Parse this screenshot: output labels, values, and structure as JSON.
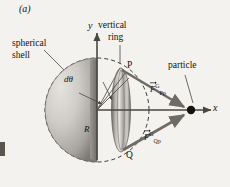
{
  "figure": {
    "panel_label": "(a)",
    "background_color": "#f4f2ee",
    "ink_color": "#14110f"
  },
  "axes": {
    "y_label": "y",
    "x_label": "x",
    "origin": {
      "x": 97,
      "y": 110
    }
  },
  "callouts": {
    "shell_line1": "spherical",
    "shell_line2": "shell",
    "ring_line1": "vertical",
    "ring_line2": "ring",
    "particle": "particle"
  },
  "points": {
    "p_label": "P",
    "q_label": "Q",
    "radius_label": "R",
    "angle_label": "dθ"
  },
  "forces": [
    {
      "name": "force-p-on-particle",
      "base": "F",
      "superscript": "G",
      "subscript": "Pp",
      "label_text": "F⃗ G Pp"
    },
    {
      "name": "force-q-on-particle",
      "base": "F",
      "superscript": "G",
      "subscript": "Qp",
      "label_text": "F⃗ G Qp"
    }
  ],
  "shapes": {
    "shell_fill_light": "#d8d5d0",
    "shell_fill_dark": "#8d8a86",
    "ring_fill": "#b5b2ae",
    "dash_color": "#3a3734",
    "arrow_color": "#6e6a66"
  }
}
